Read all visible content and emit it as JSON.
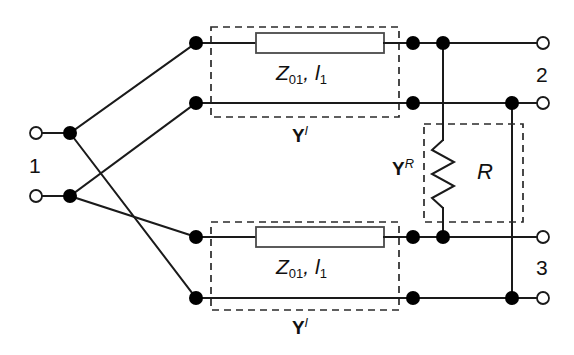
{
  "diagram": {
    "background": "#ffffff",
    "wire_color": "#1a1a1a",
    "dashed_color": "#2a2a2a"
  },
  "ports": [
    {
      "id": "port-1",
      "label": "1",
      "x": 36,
      "y": 165,
      "terminals": [
        133,
        196
      ]
    },
    {
      "id": "port-2",
      "label": "2",
      "x": 543,
      "y": 75,
      "terminals": [
        43,
        103
      ]
    },
    {
      "id": "port-3",
      "label": "3",
      "x": 543,
      "y": 268,
      "terminals": [
        237,
        298
      ]
    }
  ],
  "blocks": [
    {
      "id": "tline-top",
      "kind": "transmission-line",
      "impedance": "Z",
      "impedance_sub": "01",
      "length": "l",
      "length_sub": "1",
      "label_text": "Z01, l1",
      "group_label": "Y",
      "group_label_sup": "l"
    },
    {
      "id": "tline-bottom",
      "kind": "transmission-line",
      "impedance": "Z",
      "impedance_sub": "01",
      "length": "l",
      "length_sub": "1",
      "label_text": "Z01, l1",
      "group_label": "Y",
      "group_label_sup": "l"
    },
    {
      "id": "resistor-block",
      "kind": "resistor",
      "label": "R",
      "group_label": "Y",
      "group_label_sup": "R"
    }
  ],
  "labels": {
    "port1": "1",
    "port2": "2",
    "port3": "3",
    "resistor": "R",
    "tl_z": "Z",
    "tl_z_sub": "01",
    "tl_l": "l",
    "tl_l_sub": "1",
    "tl_comma": ", ",
    "admittance_y": "Y",
    "admittance_sup_line": "l",
    "admittance_sup_res": "R"
  }
}
